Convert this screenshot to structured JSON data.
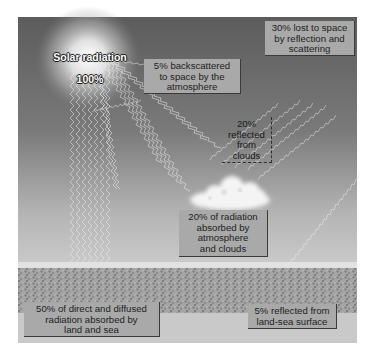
{
  "diagram": {
    "sun": {
      "label_line1": "Solar radiation",
      "label_line2": "100%"
    },
    "labels": {
      "backscattered": "5% backscattered\nto space by the\natmosphere",
      "lost_to_space": "30% lost to space\nby reflection and\nscattering",
      "reflected_clouds": "20%\nreflected\nfrom\nclouds",
      "absorbed_atmosphere": "20% of radiation\nabsorbed by\natmosphere\nand clouds",
      "absorbed_land_sea": "50% of direct and diffused\nradiation absorbed by\nland and sea",
      "reflected_surface": "5% reflected from\nland-sea surface"
    },
    "colors": {
      "sky_top": "#5a5a5a",
      "sky_bottom": "#cfcfcf",
      "label_box": "#a9a9a9",
      "label_shadow": "#3a3a3a",
      "ray": "#f2f2f2"
    }
  }
}
